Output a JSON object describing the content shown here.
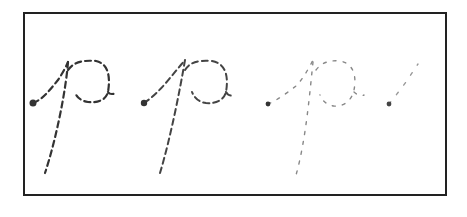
{
  "figure": {
    "letter": "p",
    "colors": {
      "frame": "#222222",
      "stroke_dark": "#333333",
      "stroke_mid": "#555555",
      "stroke_light": "#8a8a8a",
      "stroke_faint": "#9a9a9a"
    },
    "traces": [
      {
        "index": 1,
        "opacity": 1.0,
        "completeness": "full"
      },
      {
        "index": 2,
        "opacity": 0.9,
        "completeness": "full"
      },
      {
        "index": 3,
        "opacity": 0.55,
        "completeness": "sparse"
      },
      {
        "index": 4,
        "opacity": 0.5,
        "completeness": "start-stroke-only"
      }
    ]
  }
}
